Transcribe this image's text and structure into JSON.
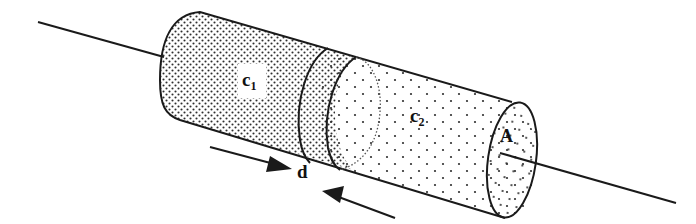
{
  "diagram": {
    "labels": {
      "c1_main": "c",
      "c1_sub": "1",
      "c2_main": "c",
      "c2_sub": "2",
      "d": "d",
      "A": "A"
    },
    "colors": {
      "stroke": "#1a1a1a",
      "background": "#ffffff",
      "dense_dots": "#333333",
      "sparse_dots": "#333333"
    },
    "regions": [
      {
        "name": "cylinder-c1",
        "pattern": "dense-dots"
      },
      {
        "name": "overlap-region",
        "pattern": "dense-dots"
      },
      {
        "name": "cylinder-c2",
        "pattern": "sparse-dots"
      }
    ],
    "arrows": [
      {
        "name": "arrow-right",
        "direction": "right-down"
      },
      {
        "name": "arrow-left",
        "direction": "left-up"
      }
    ]
  }
}
